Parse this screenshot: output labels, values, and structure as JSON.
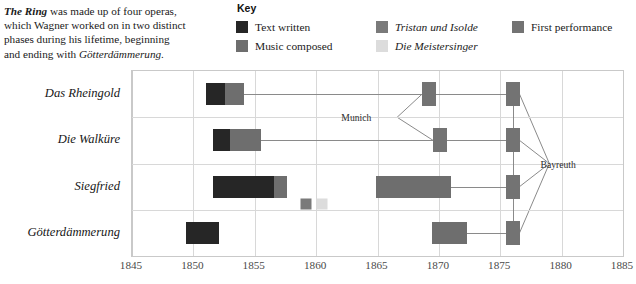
{
  "intro": {
    "lead": "The Ring",
    "rest_1": " was made up of four operas,",
    "line_2": "which Wagner worked on in two distinct",
    "line_3": "phases during his lifetime, beginning",
    "line_4_a": "and ending with ",
    "line_4_em": "Götterdämmerung."
  },
  "key": {
    "title": "Key",
    "items": [
      {
        "label": "Text written",
        "color": "#262626",
        "italic": false,
        "col": 1
      },
      {
        "label": "Music composed",
        "color": "#6e6e6e",
        "italic": false,
        "col": 1
      },
      {
        "label": "Tristan und Isolde",
        "color": "#7a7a7a",
        "italic": true,
        "col": 2
      },
      {
        "label": "Die Meistersinger",
        "color": "#dcdcdc",
        "italic": true,
        "col": 2
      },
      {
        "label": "First performance",
        "color": "#737373",
        "italic": false,
        "col": 3
      }
    ]
  },
  "chart_data": {
    "type": "bar",
    "subtype": "gantt-timeline",
    "title": "",
    "xlabel": "",
    "ylabel": "",
    "xlim": [
      1845,
      1885
    ],
    "xticks": [
      1845,
      1850,
      1855,
      1860,
      1865,
      1870,
      1875,
      1880,
      1885
    ],
    "grid": true,
    "categories": [
      "Das Rheingold",
      "Die Walküre",
      "Siegfried",
      "Götterdämmerung"
    ],
    "series": [
      {
        "name": "Text written",
        "color": "#262626",
        "spans": [
          {
            "row": "Das Rheingold",
            "start": 1851.0,
            "end": 1852.6
          },
          {
            "row": "Die Walküre",
            "start": 1851.6,
            "end": 1853.0
          },
          {
            "row": "Siegfried",
            "start": 1851.6,
            "end": 1856.6
          },
          {
            "row": "Götterdämmerung",
            "start": 1849.4,
            "end": 1852.1
          }
        ]
      },
      {
        "name": "Music composed",
        "color": "#6e6e6e",
        "spans": [
          {
            "row": "Das Rheingold",
            "start": 1852.6,
            "end": 1854.1
          },
          {
            "row": "Die Walküre",
            "start": 1853.0,
            "end": 1855.5
          },
          {
            "row": "Siegfried",
            "start": 1856.6,
            "end": 1857.6
          },
          {
            "row": "Siegfried",
            "start": 1864.9,
            "end": 1871.0
          },
          {
            "row": "Götterdämmerung",
            "start": 1869.4,
            "end": 1872.3
          }
        ]
      },
      {
        "name": "Tristan und Isolde",
        "color": "#7a7a7a",
        "spans": [
          {
            "row": "Siegfried-gap",
            "start": 1858.7,
            "end": 1859.6
          }
        ]
      },
      {
        "name": "Die Meistersinger",
        "color": "#dcdcdc",
        "spans": [
          {
            "row": "Siegfried-gap",
            "start": 1860.0,
            "end": 1860.9
          }
        ]
      },
      {
        "name": "First performance",
        "color": "#737373",
        "points": [
          {
            "row": "Das Rheingold",
            "year": 1869.2,
            "venue": "Munich"
          },
          {
            "row": "Das Rheingold",
            "year": 1876.0,
            "venue": "Bayreuth"
          },
          {
            "row": "Die Walküre",
            "year": 1870.1,
            "venue": "Munich"
          },
          {
            "row": "Die Walküre",
            "year": 1876.0,
            "venue": "Bayreuth"
          },
          {
            "row": "Siegfried",
            "year": 1876.0,
            "venue": "Bayreuth"
          },
          {
            "row": "Götterdämmerung",
            "year": 1876.0,
            "venue": "Bayreuth"
          }
        ]
      }
    ],
    "annotations": [
      {
        "text": "Munich",
        "year": 1864.5,
        "row_between": [
          "Das Rheingold",
          "Die Walküre"
        ]
      },
      {
        "text": "Bayreuth",
        "year": 1878.2,
        "row_between": [
          "Die Walküre",
          "Siegfried"
        ]
      }
    ]
  }
}
